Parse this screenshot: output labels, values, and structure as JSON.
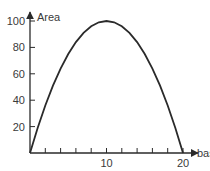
{
  "chart_data": {
    "type": "line",
    "title": "",
    "xlabel": "base",
    "ylabel": "Area",
    "xlim": [
      0,
      20
    ],
    "ylim": [
      0,
      100
    ],
    "x_ticks": [
      2,
      4,
      6,
      8,
      10,
      12,
      14,
      16,
      18,
      20
    ],
    "x_tick_labels": [
      "10",
      "20"
    ],
    "y_ticks": [
      20,
      40,
      60,
      80,
      100
    ],
    "y_tick_labels": [
      "20",
      "40",
      "60",
      "80",
      "100"
    ],
    "grid": false,
    "legend": null,
    "series": [
      {
        "name": "Area = base × (20 − base)",
        "x": [
          0,
          1,
          2,
          3,
          4,
          5,
          6,
          7,
          8,
          9,
          10,
          11,
          12,
          13,
          14,
          15,
          16,
          17,
          18,
          19,
          20
        ],
        "values": [
          0,
          19,
          36,
          51,
          64,
          75,
          84,
          91,
          96,
          99,
          100,
          99,
          96,
          91,
          84,
          75,
          64,
          51,
          36,
          19,
          0
        ]
      }
    ],
    "annotations": []
  },
  "colors": {
    "ink": "#2a2a2a",
    "text": "#3a3a3a",
    "background": "#ffffff"
  }
}
